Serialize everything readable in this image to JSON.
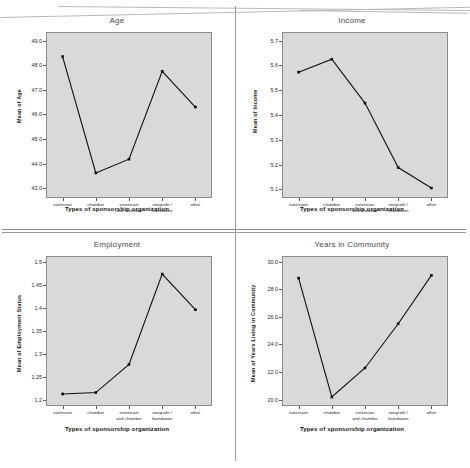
{
  "document": {
    "kind": "scanned-figure-page",
    "layout": "2x2 panel grid of line charts"
  },
  "shared": {
    "x_axis_title": "Types of sponsorship organization",
    "categories": [
      "extension",
      "chamber",
      "extension\nand chamber",
      "nonprofit /\nfoundation",
      "other"
    ],
    "plot_background": "#d9d9d9",
    "line_color": "#111111",
    "marker_color": "#000000"
  },
  "chart_data": [
    {
      "type": "line",
      "title": "Age",
      "panel": "top-left",
      "xlabel": "Types of sponsorship organization",
      "ylabel": "Mean of Age",
      "categories": [
        "extension",
        "chamber",
        "extension and chamber",
        "nonprofit / foundation",
        "other"
      ],
      "values": [
        48.35,
        43.62,
        44.18,
        47.75,
        46.3
      ],
      "ylim": [
        42.6,
        49.35
      ],
      "yticks": [
        "43.0",
        "44.0",
        "45.0",
        "46.0",
        "47.0",
        "48.0",
        "49.0"
      ],
      "ytick_values": [
        43.0,
        44.0,
        45.0,
        46.0,
        47.0,
        48.0,
        49.0
      ],
      "grid": false,
      "legend": "none"
    },
    {
      "type": "line",
      "title": "Income",
      "panel": "top-right",
      "xlabel": "Types of sponsorship organization",
      "ylabel": "Mean of Income",
      "categories": [
        "extension",
        "chamber",
        "extension and chamber",
        "nonprofit / foundation",
        "other"
      ],
      "values": [
        5.573,
        5.625,
        5.448,
        5.188,
        5.105
      ],
      "ylim": [
        5.065,
        5.735
      ],
      "yticks": [
        "5.1",
        "5.2",
        "5.3",
        "5.4",
        "5.5",
        "5.6",
        "5.7"
      ],
      "ytick_values": [
        5.1,
        5.2,
        5.3,
        5.4,
        5.5,
        5.6,
        5.7
      ],
      "grid": false,
      "legend": "none"
    },
    {
      "type": "line",
      "title": "Employment",
      "panel": "bottom-left",
      "xlabel": "Types of sponsorship organization",
      "ylabel": "Mean of Employment Status",
      "categories": [
        "extension",
        "chamber",
        "extension and chamber",
        "nonprofit / foundation",
        "other"
      ],
      "values": [
        1.214,
        1.217,
        1.278,
        1.473,
        1.396
      ],
      "ylim": [
        1.188,
        1.512
      ],
      "yticks": [
        "1.2",
        "1.25",
        "1.3",
        "1.35",
        "1.4",
        "1.45",
        "1.5"
      ],
      "ytick_values": [
        1.2,
        1.25,
        1.3,
        1.35,
        1.4,
        1.45,
        1.5
      ],
      "grid": false,
      "legend": "none"
    },
    {
      "type": "line",
      "title": "Years in Community",
      "panel": "bottom-right",
      "xlabel": "Types of sponsorship organization",
      "ylabel": "Mean of Years Living in Community",
      "categories": [
        "extension",
        "chamber",
        "extension and chamber",
        "nonprofit / foundation",
        "other"
      ],
      "values": [
        28.8,
        20.2,
        22.3,
        25.5,
        29.0
      ],
      "ylim": [
        19.55,
        30.4
      ],
      "yticks": [
        "20.0",
        "22.0",
        "24.0",
        "26.0",
        "28.0",
        "30.0"
      ],
      "ytick_values": [
        20.0,
        22.0,
        24.0,
        26.0,
        28.0,
        30.0
      ],
      "grid": false,
      "legend": "none"
    }
  ]
}
